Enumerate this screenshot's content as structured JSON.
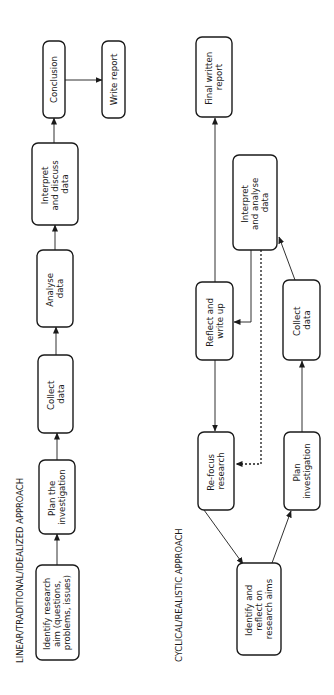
{
  "linear": {
    "title": "LINEAR/TRADITIONAL/IDEALIZED APPROACH",
    "steps": [
      {
        "id": "identify",
        "lines": [
          "Identify research",
          "aim (questions,",
          "problems, issues)"
        ]
      },
      {
        "id": "plan",
        "lines": [
          "Plan the",
          "investigation"
        ]
      },
      {
        "id": "collect",
        "lines": [
          "Collect",
          "data"
        ]
      },
      {
        "id": "analyse",
        "lines": [
          "Analyse",
          "data"
        ]
      },
      {
        "id": "interpret",
        "lines": [
          "Interpret",
          "and discuss",
          "data"
        ]
      },
      {
        "id": "conclusion",
        "lines": [
          "Conclusion"
        ]
      },
      {
        "id": "write",
        "lines": [
          "Write report"
        ]
      }
    ]
  },
  "cyclical": {
    "title": "CYCLICAL/REALISTIC APPROACH",
    "steps": [
      {
        "id": "identify",
        "lines": [
          "Identify and",
          "reflect on",
          "research aims"
        ]
      },
      {
        "id": "refocus",
        "lines": [
          "Re-focus",
          "research"
        ]
      },
      {
        "id": "plan",
        "lines": [
          "Plan",
          "investigation"
        ]
      },
      {
        "id": "collect",
        "lines": [
          "Collect",
          "data"
        ]
      },
      {
        "id": "reflect",
        "lines": [
          "Reflect and",
          "write up"
        ]
      },
      {
        "id": "interpret",
        "lines": [
          "Interpret",
          "and analyse",
          "data"
        ]
      },
      {
        "id": "final",
        "lines": [
          "Final written",
          "report"
        ]
      }
    ]
  }
}
